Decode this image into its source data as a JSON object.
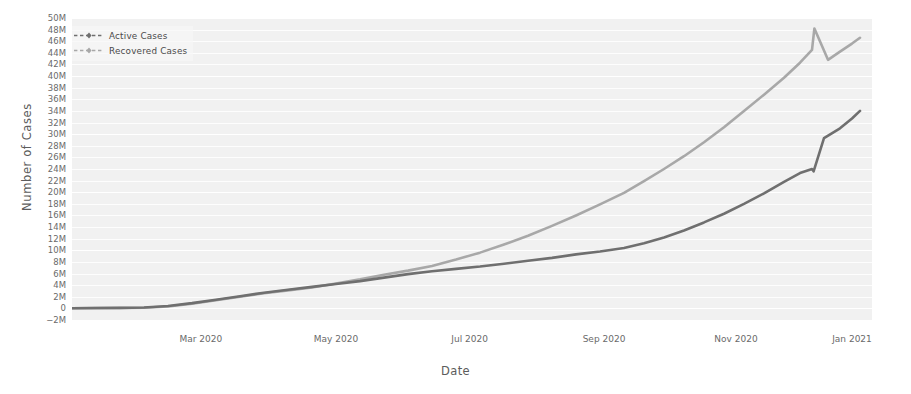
{
  "chart_data": {
    "type": "line",
    "title": "",
    "xlabel": "Date",
    "ylabel": "Number of Cases",
    "grid": true,
    "legend_position": "upper left",
    "xlim": [
      "2020-01-22",
      "2021-01-10"
    ],
    "ylim": [
      -2000000,
      50000000
    ],
    "ytick_labels": [
      "50M",
      "48M",
      "46M",
      "44M",
      "42M",
      "40M",
      "38M",
      "36M",
      "34M",
      "32M",
      "30M",
      "28M",
      "26M",
      "24M",
      "22M",
      "20M",
      "18M",
      "16M",
      "14M",
      "12M",
      "10M",
      "8M",
      "6M",
      "4M",
      "2M",
      "0",
      "−2M"
    ],
    "ytick_values": [
      50000000,
      48000000,
      46000000,
      44000000,
      42000000,
      40000000,
      38000000,
      36000000,
      34000000,
      32000000,
      30000000,
      28000000,
      26000000,
      24000000,
      22000000,
      20000000,
      18000000,
      16000000,
      14000000,
      12000000,
      10000000,
      8000000,
      6000000,
      4000000,
      2000000,
      0,
      -2000000
    ],
    "xtick_labels": [
      "Mar 2020",
      "May 2020",
      "Jul 2020",
      "Sep 2020",
      "Nov 2020",
      "Jan 2021"
    ],
    "xtick_positions": [
      0.161,
      0.33,
      0.497,
      0.665,
      0.83,
      0.975
    ],
    "series": [
      {
        "name": "Active Cases",
        "color": "#6f6f6f",
        "linestyle": "dashed",
        "marker": "diamond",
        "x": [
          0.0,
          0.03,
          0.06,
          0.09,
          0.12,
          0.15,
          0.18,
          0.21,
          0.24,
          0.27,
          0.3,
          0.33,
          0.36,
          0.39,
          0.42,
          0.45,
          0.48,
          0.51,
          0.54,
          0.57,
          0.6,
          0.63,
          0.66,
          0.69,
          0.715,
          0.74,
          0.765,
          0.79,
          0.815,
          0.84,
          0.865,
          0.89,
          0.91,
          0.925,
          0.927,
          0.94,
          0.96,
          0.975,
          0.985
        ],
        "y": [
          30000,
          60000,
          90000,
          150000,
          400000,
          900000,
          1500000,
          2100000,
          2700000,
          3200000,
          3700000,
          4200000,
          4700000,
          5300000,
          5900000,
          6400000,
          6800000,
          7200000,
          7700000,
          8200000,
          8700000,
          9300000,
          9800000,
          10400000,
          11200000,
          12200000,
          13400000,
          14800000,
          16300000,
          18000000,
          19800000,
          21800000,
          23300000,
          24000000,
          23600000,
          29300000,
          31000000,
          32700000,
          34000000
        ],
        "final_value": 34000000
      },
      {
        "name": "Recovered Cases",
        "color": "#a8a8a8",
        "linestyle": "dashed",
        "marker": "diamond",
        "x": [
          0.0,
          0.03,
          0.06,
          0.09,
          0.12,
          0.15,
          0.18,
          0.21,
          0.24,
          0.27,
          0.3,
          0.33,
          0.36,
          0.39,
          0.42,
          0.45,
          0.48,
          0.51,
          0.54,
          0.57,
          0.6,
          0.63,
          0.66,
          0.69,
          0.715,
          0.74,
          0.765,
          0.79,
          0.815,
          0.84,
          0.865,
          0.89,
          0.91,
          0.925,
          0.928,
          0.945,
          0.96,
          0.975,
          0.985
        ],
        "y": [
          20000,
          40000,
          70000,
          120000,
          330000,
          800000,
          1400000,
          2000000,
          2600000,
          3100000,
          3600000,
          4300000,
          5000000,
          5800000,
          6500000,
          7300000,
          8400000,
          9600000,
          11000000,
          12500000,
          14200000,
          16000000,
          17900000,
          19900000,
          21900000,
          24000000,
          26200000,
          28600000,
          31200000,
          34000000,
          36800000,
          39700000,
          42300000,
          44500000,
          48200000,
          42800000,
          44200000,
          45600000,
          46600000
        ],
        "final_value": 46600000
      }
    ],
    "annotations": [
      {
        "text": "data discontinuity mid-Dec 2020: recovered spike then drop; active step jump",
        "x": 0.926
      }
    ]
  },
  "legend": {
    "items": [
      {
        "label": "Active Cases"
      },
      {
        "label": "Recovered Cases"
      }
    ]
  },
  "axes": {
    "xlabel": "Date",
    "ylabel": "Number of Cases"
  }
}
